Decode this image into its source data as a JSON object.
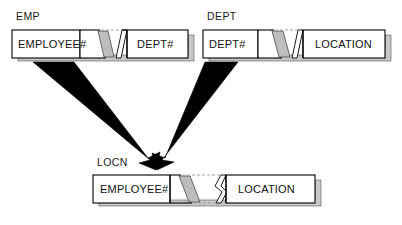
{
  "diagram": {
    "title_hidden": "",
    "type": "entity-join-diagram",
    "background_color": "#ffffff",
    "line_color": "#000000",
    "shadow_color": "#c8c8c8",
    "torn_fill_color": "#bdbdbd",
    "arrow_color": "#000000"
  },
  "tables": [
    {
      "id": "emp",
      "label": "EMP",
      "label_x": 16,
      "label_y": 10,
      "x": 12,
      "y": 30,
      "width": 176,
      "height": 28,
      "columns": [
        {
          "name": "EMPLOYEE#",
          "text_x": 18,
          "text_y": 48
        },
        {
          "name": "DEPT#",
          "text_x": 137,
          "text_y": 48
        }
      ],
      "torn_gap": {
        "start": 80,
        "end": 124
      }
    },
    {
      "id": "dept",
      "label": "DEPT",
      "label_x": 207,
      "label_y": 10,
      "x": 203,
      "y": 30,
      "width": 182,
      "height": 28,
      "columns": [
        {
          "name": "DEPT#",
          "text_x": 209,
          "text_y": 48
        },
        {
          "name": "LOCATION",
          "text_x": 315,
          "text_y": 48
        }
      ],
      "torn_gap": {
        "start": 258,
        "end": 298
      }
    },
    {
      "id": "locn",
      "label": "LOCN",
      "label_x": 97,
      "label_y": 156,
      "x": 93,
      "y": 175,
      "width": 222,
      "height": 28,
      "columns": [
        {
          "name": "EMPLOYEE#",
          "text_x": 100,
          "text_y": 193
        },
        {
          "name": "LOCATION",
          "text_x": 238,
          "text_y": 193
        }
      ],
      "torn_gap": {
        "start": 170,
        "end": 230
      }
    }
  ],
  "arrows": [
    {
      "id": "emp-to-locn",
      "from_table": "EMP",
      "to_table": "LOCN",
      "start_x": 46,
      "start_y": 63,
      "end_x": 155,
      "end_y": 169
    },
    {
      "id": "dept-to-locn",
      "from_table": "DEPT",
      "to_table": "LOCN",
      "start_x": 224,
      "start_y": 63,
      "end_x": 158,
      "end_y": 169
    }
  ]
}
